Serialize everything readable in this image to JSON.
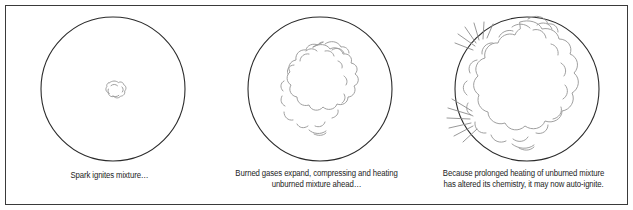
{
  "figure": {
    "title_alt": "Three-stage combustion sequence in a cylinder",
    "frame_color": "#3a3a3a",
    "background_color": "#ffffff",
    "cylinder_stroke_color": "#2b2b2b",
    "flame_stroke_color": "#8c8c8c",
    "spark_stroke_color": "#8c8c8c",
    "caption_color": "#1d1d1d"
  },
  "panels": [
    {
      "id": "panel-1",
      "stage": "spark-ignition",
      "caption": "Spark ignites mixture…",
      "cylinder": {
        "cx": 113,
        "cy": 88,
        "r": 72
      },
      "flame": {
        "cx": 113,
        "cy": 88,
        "r": 10,
        "label": "small-kernel"
      },
      "sparks": []
    },
    {
      "id": "panel-2",
      "stage": "flame-propagation",
      "caption": "Burned gases expand, compressing and heating\nunburned mixture ahead…",
      "cylinder": {
        "cx": 320,
        "cy": 88,
        "r": 72
      },
      "flame": {
        "cx": 313,
        "cy": 90,
        "r": 45,
        "label": "medium-flame-front"
      },
      "sparks": []
    },
    {
      "id": "panel-3",
      "stage": "end-gas-autoignition",
      "caption": "Because prolonged heating of unburned mixture\nhas altered its chemistry, it may now auto-ignite.",
      "cylinder": {
        "cx": 528,
        "cy": 88,
        "r": 72
      },
      "flame": {
        "cx": 535,
        "cy": 88,
        "r": 63,
        "label": "large-flame-front"
      },
      "sparks": [
        {
          "x": 482,
          "y": 40,
          "label": "spark-burst-upper-left"
        },
        {
          "x": 470,
          "y": 120,
          "label": "spark-burst-lower-left"
        }
      ]
    }
  ]
}
